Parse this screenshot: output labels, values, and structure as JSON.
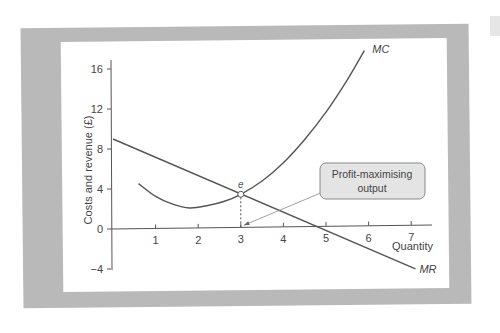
{
  "chart_data": {
    "type": "line",
    "title": "",
    "xlabel": "Quantity",
    "ylabel": "Costs and revenue (£)",
    "xlim": [
      0,
      7.5
    ],
    "ylim": [
      -4,
      17.5
    ],
    "x_ticks": [
      "1",
      "2",
      "3",
      "4",
      "5",
      "6",
      "7"
    ],
    "y_ticks": [
      "16",
      "12",
      "8",
      "4",
      "0",
      "−4"
    ],
    "grid": false,
    "series": [
      {
        "name": "MC",
        "label": "MC",
        "points": [
          [
            0.6,
            4.5
          ],
          [
            1.0,
            3.2
          ],
          [
            1.4,
            2.4
          ],
          [
            1.8,
            2.0
          ],
          [
            2.2,
            2.2
          ],
          [
            2.6,
            2.6
          ],
          [
            3.0,
            3.3
          ],
          [
            3.5,
            4.6
          ],
          [
            4.0,
            6.4
          ],
          [
            4.5,
            8.7
          ],
          [
            5.0,
            11.4
          ],
          [
            5.5,
            14.6
          ],
          [
            5.9,
            17.5
          ]
        ]
      },
      {
        "name": "MR",
        "label": "MR",
        "points": [
          [
            0,
            9.0
          ],
          [
            7.1,
            -4.4
          ]
        ]
      }
    ],
    "annotations": {
      "intersection_label": "e",
      "intersection_point": [
        3,
        3.3
      ],
      "callout_text_line1": "Profit-maximising",
      "callout_text_line2": "output",
      "callout_points_to": [
        3,
        0
      ]
    },
    "colors": {
      "frame": "#b9b9b9",
      "line": "#555555",
      "callout_fill": "#e4e4e4",
      "callout_stroke": "#8a8a8a"
    }
  }
}
